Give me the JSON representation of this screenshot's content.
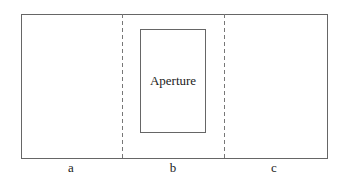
{
  "diagram": {
    "aperture_label": "Aperture",
    "regions": [
      {
        "id": "a",
        "label": "a"
      },
      {
        "id": "b",
        "label": "b"
      },
      {
        "id": "c",
        "label": "c"
      }
    ],
    "colors": {
      "line": "#666666",
      "text": "#222222"
    }
  }
}
